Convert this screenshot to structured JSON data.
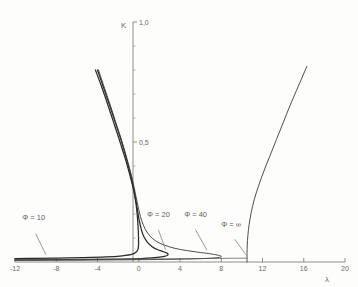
{
  "chart_data": {
    "type": "line",
    "title": "",
    "xlabel": "λ",
    "ylabel": "K",
    "xlim": [
      -12,
      20
    ],
    "ylim": [
      0,
      1.0
    ],
    "grid": false,
    "legend_position": "inline-annotations",
    "x_ticks": [
      "-12",
      "-8",
      "-4",
      "0",
      "4",
      "8",
      "12",
      "16",
      "20"
    ],
    "x_tick_values": [
      -12,
      -8,
      -4,
      0,
      4,
      8,
      12,
      16,
      20
    ],
    "y_ticks": [
      "0,5",
      "1,0"
    ],
    "y_tick_values": [
      0.5,
      1.0
    ],
    "y_minor_tick_values": [
      0.1,
      0.2,
      0.3,
      0.4,
      0.6,
      0.7,
      0.8,
      0.9
    ],
    "line_color": "#3a3a3a",
    "axis_color": "#8d8d8d",
    "background_color": "#fdfdfb",
    "annotations": [
      {
        "id": "phi-10",
        "label": "Φ = 10",
        "label_x": -11.3,
        "label_y": 0.175
      },
      {
        "id": "phi-20",
        "label": "Φ = 20",
        "label_x": 0.8,
        "label_y": 0.188
      },
      {
        "id": "phi-40",
        "label": "Φ = 40",
        "label_x": 4.4,
        "label_y": 0.188
      },
      {
        "id": "phi-inf",
        "label": "Φ = ∞",
        "label_x": 8.0,
        "label_y": 0.145
      }
    ],
    "series": [
      {
        "name": "Φ = 10",
        "points": [
          [
            -4.2,
            0.8
          ],
          [
            -3.6,
            0.73
          ],
          [
            -3.0,
            0.655
          ],
          [
            -2.5,
            0.59
          ],
          [
            -2.0,
            0.525
          ],
          [
            -1.6,
            0.47
          ],
          [
            -1.2,
            0.415
          ],
          [
            -0.9,
            0.368
          ],
          [
            -0.6,
            0.318
          ],
          [
            -0.4,
            0.278
          ],
          [
            -0.25,
            0.238
          ],
          [
            -0.15,
            0.198
          ],
          [
            -0.08,
            0.158
          ],
          [
            -0.04,
            0.122
          ],
          [
            -0.02,
            0.095
          ],
          [
            -0.02,
            0.072
          ],
          [
            -0.06,
            0.055
          ],
          [
            -0.2,
            0.043
          ],
          [
            -0.6,
            0.033
          ],
          [
            -1.6,
            0.026
          ],
          [
            -3.2,
            0.021
          ],
          [
            -5.5,
            0.018
          ],
          [
            -8.0,
            0.016
          ],
          [
            -10.2,
            0.015
          ],
          [
            -12.0,
            0.0145
          ]
        ]
      },
      {
        "name": "Φ = 20",
        "points": [
          [
            -4.0,
            0.8
          ],
          [
            -3.4,
            0.725
          ],
          [
            -2.8,
            0.65
          ],
          [
            -2.3,
            0.585
          ],
          [
            -1.8,
            0.52
          ],
          [
            -1.4,
            0.462
          ],
          [
            -1.05,
            0.408
          ],
          [
            -0.75,
            0.358
          ],
          [
            -0.5,
            0.308
          ],
          [
            -0.3,
            0.262
          ],
          [
            -0.12,
            0.215
          ],
          [
            0.05,
            0.172
          ],
          [
            0.25,
            0.135
          ],
          [
            0.5,
            0.105
          ],
          [
            0.85,
            0.082
          ],
          [
            1.3,
            0.064
          ],
          [
            1.8,
            0.052
          ],
          [
            2.3,
            0.044
          ],
          [
            2.7,
            0.038
          ],
          [
            2.85,
            0.032
          ],
          [
            2.7,
            0.026
          ],
          [
            2.2,
            0.021
          ],
          [
            1.3,
            0.017
          ],
          [
            0.2,
            0.0145
          ],
          [
            -1.5,
            0.0125
          ],
          [
            -4.0,
            0.011
          ],
          [
            -7.0,
            0.0098
          ],
          [
            -10.0,
            0.0092
          ],
          [
            -12.0,
            0.009
          ]
        ]
      },
      {
        "name": "Φ = 40",
        "points": [
          [
            -3.9,
            0.8
          ],
          [
            -3.3,
            0.722
          ],
          [
            -2.7,
            0.645
          ],
          [
            -2.2,
            0.578
          ],
          [
            -1.7,
            0.512
          ],
          [
            -1.3,
            0.455
          ],
          [
            -0.95,
            0.4
          ],
          [
            -0.65,
            0.35
          ],
          [
            -0.4,
            0.3
          ],
          [
            -0.18,
            0.255
          ],
          [
            0.05,
            0.21
          ],
          [
            0.3,
            0.17
          ],
          [
            0.65,
            0.135
          ],
          [
            1.1,
            0.108
          ],
          [
            1.7,
            0.086
          ],
          [
            2.5,
            0.07
          ],
          [
            3.5,
            0.057
          ],
          [
            4.6,
            0.048
          ],
          [
            5.7,
            0.041
          ],
          [
            6.8,
            0.035
          ],
          [
            7.6,
            0.029
          ],
          [
            8.0,
            0.024
          ],
          [
            7.8,
            0.019
          ],
          [
            6.8,
            0.0155
          ],
          [
            5.0,
            0.0128
          ],
          [
            2.5,
            0.0108
          ],
          [
            -0.5,
            0.0094
          ],
          [
            -4.0,
            0.0083
          ],
          [
            -8.0,
            0.0076
          ],
          [
            -12.0,
            0.0072
          ]
        ]
      },
      {
        "name": "Φ = ∞",
        "points": [
          [
            10.5,
            0.0
          ],
          [
            10.5,
            0.035
          ],
          [
            10.52,
            0.07
          ],
          [
            10.58,
            0.11
          ],
          [
            10.7,
            0.155
          ],
          [
            10.9,
            0.205
          ],
          [
            11.2,
            0.26
          ],
          [
            11.6,
            0.315
          ],
          [
            12.1,
            0.375
          ],
          [
            12.7,
            0.44
          ],
          [
            13.35,
            0.51
          ],
          [
            14.0,
            0.58
          ],
          [
            14.65,
            0.65
          ],
          [
            15.3,
            0.715
          ],
          [
            15.9,
            0.775
          ],
          [
            16.3,
            0.815
          ]
        ]
      },
      {
        "name": "Φ = ∞ lower branch",
        "points": [
          [
            10.5,
            0.016
          ],
          [
            9.0,
            0.0155
          ],
          [
            6.5,
            0.0145
          ],
          [
            3.5,
            0.0135
          ],
          [
            0.0,
            0.0125
          ],
          [
            -4.0,
            0.0115
          ],
          [
            -8.0,
            0.0108
          ],
          [
            -12.0,
            0.0105
          ]
        ]
      }
    ]
  }
}
